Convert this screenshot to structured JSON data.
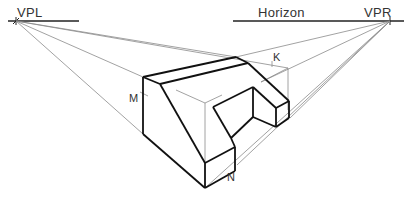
{
  "figure": {
    "labels": {
      "vpl": "VPL",
      "vpr": "VPR",
      "horizon": "Horizon",
      "k": "K",
      "m": "M",
      "n": "N"
    },
    "colors": {
      "background": "#ffffff",
      "object_line": "#111111",
      "construction_line": "#8a8a8a",
      "horizon_line": "#222222",
      "text": "#333333"
    },
    "vanishing_points": {
      "left": {
        "x": 16,
        "y": 21
      },
      "right": {
        "x": 388,
        "y": 21
      }
    }
  }
}
